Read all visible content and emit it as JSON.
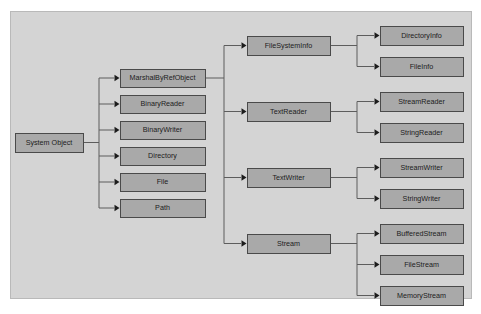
{
  "diagram": {
    "frame": {
      "x": 10,
      "y": 11,
      "width": 462,
      "height": 288,
      "background": "#d4d4d4",
      "border_color": "#b9b9b9"
    },
    "node_style": {
      "fill": "#a9a9a9",
      "border_color": "#4a4a4a",
      "text_color": "#1c1c1c",
      "connector_color": "#5d5d5d"
    },
    "root": {
      "id": "system-object",
      "label": "System Object",
      "x": 15,
      "y": 133,
      "width": 68,
      "height": 19
    },
    "level2": [
      {
        "id": "marshalbyrefobject",
        "label": "MarshalByRefObject",
        "x": 120,
        "y": 69,
        "width": 85,
        "height": 18
      },
      {
        "id": "binaryreader",
        "label": "BinaryReader",
        "x": 120,
        "y": 95,
        "width": 85,
        "height": 18
      },
      {
        "id": "binarywriter",
        "label": "BinaryWriter",
        "x": 120,
        "y": 121,
        "width": 85,
        "height": 18
      },
      {
        "id": "directory",
        "label": "Directory",
        "x": 120,
        "y": 147,
        "width": 85,
        "height": 18
      },
      {
        "id": "file",
        "label": "File",
        "x": 120,
        "y": 173,
        "width": 85,
        "height": 18
      },
      {
        "id": "path",
        "label": "Path",
        "x": 120,
        "y": 199,
        "width": 85,
        "height": 18
      }
    ],
    "level3": [
      {
        "id": "filesysteminfo",
        "label": "FileSystemInfo",
        "x": 247,
        "y": 36,
        "width": 83,
        "height": 19
      },
      {
        "id": "textreader",
        "label": "TextReader",
        "x": 247,
        "y": 102,
        "width": 83,
        "height": 19
      },
      {
        "id": "textwriter",
        "label": "TextWriter",
        "x": 247,
        "y": 168,
        "width": 83,
        "height": 19
      },
      {
        "id": "stream",
        "label": "Stream",
        "x": 247,
        "y": 234,
        "width": 83,
        "height": 19
      }
    ],
    "level4": [
      {
        "id": "directoryinfo",
        "label": "DirectoryInfo",
        "x": 380,
        "y": 26,
        "width": 83,
        "height": 19,
        "parent": "filesysteminfo"
      },
      {
        "id": "fileinfo",
        "label": "FileInfo",
        "x": 380,
        "y": 57,
        "width": 83,
        "height": 19,
        "parent": "filesysteminfo"
      },
      {
        "id": "streamreader",
        "label": "StreamReader",
        "x": 380,
        "y": 92,
        "width": 83,
        "height": 19,
        "parent": "textreader"
      },
      {
        "id": "stringreader",
        "label": "StringReader",
        "x": 380,
        "y": 123,
        "width": 83,
        "height": 19,
        "parent": "textreader"
      },
      {
        "id": "streamwriter",
        "label": "StreamWriter",
        "x": 380,
        "y": 158,
        "width": 83,
        "height": 19,
        "parent": "textwriter"
      },
      {
        "id": "stringwriter",
        "label": "StringWriter",
        "x": 380,
        "y": 189,
        "width": 83,
        "height": 19,
        "parent": "textwriter"
      },
      {
        "id": "bufferedstream",
        "label": "BufferedStream",
        "x": 380,
        "y": 224,
        "width": 83,
        "height": 19,
        "parent": "stream"
      },
      {
        "id": "filestream",
        "label": "FileStream",
        "x": 380,
        "y": 255,
        "width": 83,
        "height": 19,
        "parent": "stream"
      },
      {
        "id": "memorystream",
        "label": "MemoryStream",
        "x": 380,
        "y": 286,
        "width": 83,
        "height": 19,
        "parent": "stream"
      }
    ],
    "trunks": {
      "root_trunk_x": 99,
      "marshal_trunk_x": 224,
      "right_trunk_x": 357
    }
  }
}
